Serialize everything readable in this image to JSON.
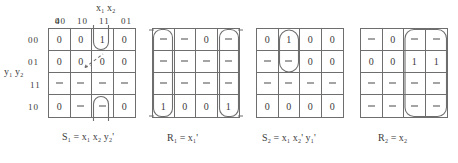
{
  "figure": {
    "col_var_label": "x₁ x₂",
    "row_var_label": "y₁ y₂",
    "col_headers": [
      "00",
      "10",
      "11",
      "01"
    ],
    "row_headers": [
      "00",
      "01",
      "11",
      "10"
    ],
    "ink_color": "#3a3a3a",
    "line_color": "#6e6e6e"
  },
  "maps": [
    {
      "id": "map-s1",
      "caption": "S₁ = x₁ x₂ y₂'",
      "caption_parts": {
        "lhs": "S",
        "lhs_sub": "1",
        "rhs": "x₁ x₂ y₂′"
      },
      "show_headers": true,
      "rows": [
        [
          "0",
          "0",
          "1",
          "0"
        ],
        [
          "0",
          "0",
          "0",
          "0"
        ],
        [
          "-",
          "-",
          "-",
          "-"
        ],
        [
          "0",
          "-",
          "-",
          "0"
        ]
      ],
      "groups": [
        {
          "name": "wrap-group-col-11",
          "cells": "row0-col2 + row3-col2",
          "wrap": true
        }
      ],
      "annotations": [
        {
          "name": "pointer-arrow",
          "target": "row1-col2"
        }
      ]
    },
    {
      "id": "map-r1",
      "caption": "R₁ = x₁'",
      "caption_parts": {
        "lhs": "R",
        "lhs_sub": "1",
        "rhs": "x₁′"
      },
      "show_headers": false,
      "rows": [
        [
          "-",
          "-",
          "0",
          "-"
        ],
        [
          "-",
          "-",
          "-",
          "-"
        ],
        [
          "-",
          "-",
          "-",
          "-"
        ],
        [
          "1",
          "0",
          "0",
          "1"
        ]
      ],
      "groups": [
        {
          "name": "group-col-00",
          "cells": "col0 rows0-3",
          "wrap": false
        },
        {
          "name": "group-col-01",
          "cells": "col3 rows0-3",
          "wrap": false
        }
      ],
      "annotations": []
    },
    {
      "id": "map-s2",
      "caption": "S₂ = x₁ x₂' y₁'",
      "caption_parts": {
        "lhs": "S",
        "lhs_sub": "2",
        "rhs": "x₁ x₂′ y₁′"
      },
      "show_headers": false,
      "rows": [
        [
          "0",
          "1",
          "0",
          "0"
        ],
        [
          "-",
          "-",
          "0",
          "0"
        ],
        [
          "-",
          "-",
          "-",
          "-"
        ],
        [
          "0",
          "0",
          "0",
          "0"
        ]
      ],
      "groups": [
        {
          "name": "group-col-10-rows-0-1",
          "cells": "col1 rows0-1",
          "wrap": false
        }
      ],
      "annotations": []
    },
    {
      "id": "map-r2",
      "caption": "R₂ = x₂",
      "caption_parts": {
        "lhs": "R",
        "lhs_sub": "2",
        "rhs": "x₂"
      },
      "show_headers": false,
      "rows": [
        [
          "-",
          "0",
          "-",
          "-"
        ],
        [
          "0",
          "0",
          "1",
          "1"
        ],
        [
          "-",
          "-",
          "-",
          "-"
        ],
        [
          "-",
          "-",
          "-",
          "-"
        ]
      ],
      "groups": [
        {
          "name": "group-cols-11-01",
          "cells": "col2-col3 rows0-3",
          "wrap": false
        }
      ],
      "annotations": []
    }
  ]
}
